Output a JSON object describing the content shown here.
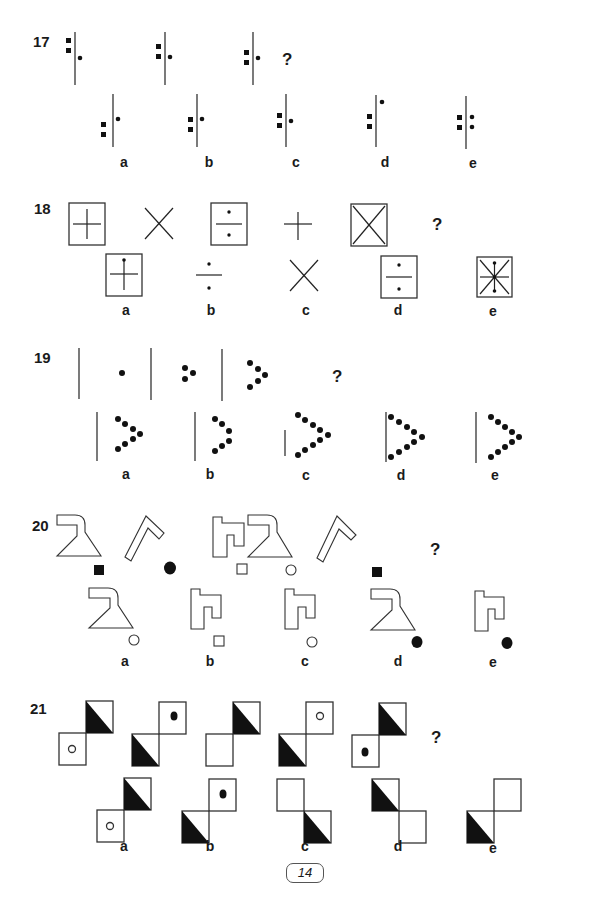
{
  "page": {
    "number": "14"
  },
  "questions": [
    {
      "number": "17",
      "prompt_mark": "?",
      "options": [
        "a",
        "b",
        "c",
        "d",
        "e"
      ],
      "sequence": [
        "line, 2 squares left (top), dot right (middle)",
        "line, 2 squares left (mid), dot right",
        "line, 2 squares left (lower), dot right"
      ],
      "answers": [
        "line, squares low, dot high",
        "line, squares mid, dot mid",
        "line, squares mid, dot mid",
        "line, squares mid, dot top",
        "line, 2 squares left, 2 dots right"
      ]
    },
    {
      "number": "18",
      "prompt_mark": "?",
      "options": [
        "a",
        "b",
        "c",
        "d",
        "e"
      ],
      "sequence": [
        "boxed plus",
        "cross",
        "boxed divide",
        "plus",
        "boxed cross"
      ],
      "answers": [
        "boxed plus with dot",
        "divide",
        "cross",
        "boxed divide",
        "boxed star with dots"
      ]
    },
    {
      "number": "19",
      "prompt_mark": "?",
      "options": [
        "a",
        "b",
        "c",
        "d",
        "e"
      ],
      "sequence": [
        "line + 1 dot",
        "line + 3 dots",
        "line + 5 dots"
      ],
      "answers": [
        "line + 7 dots",
        "line + 5 dots",
        "short line + 9 dots",
        "line + 9 dots",
        "line + 9 dots"
      ]
    },
    {
      "number": "20",
      "prompt_mark": "?",
      "options": [
        "a",
        "b",
        "c",
        "d",
        "e"
      ],
      "sequence": [
        "funnel + black square",
        "chevron + black circle",
        "hook + white square",
        "funnel + white circle",
        "chevron + black square"
      ],
      "answers": [
        "funnel + white circle",
        "hook + white square",
        "hook + white circle",
        "funnel + black circle",
        "hook + black circle"
      ]
    },
    {
      "number": "21",
      "prompt_mark": "?",
      "options": [
        "a",
        "b",
        "c",
        "d",
        "e"
      ],
      "sequence": [
        "diag squares, top half-black, bottom white circle",
        "bottom half-black, top black dot",
        "top half-black, bottom empty",
        "bottom half-black, top white circle",
        "top half-black, bottom black dot"
      ],
      "answers": [
        "top half-black, bottom white circle",
        "bottom half-black, top black dot",
        "top empty, bottom-right half-black",
        "top-left half-black, bottom-right empty",
        "bottom-left half-black, top-right empty"
      ]
    }
  ]
}
